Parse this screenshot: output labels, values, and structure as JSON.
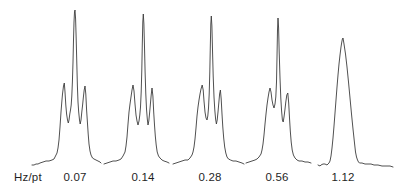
{
  "colors": {
    "background": "#ffffff",
    "trace": "#3c3c3c",
    "text": "#1f1f1f"
  },
  "chart_data": {
    "type": "line",
    "title": "",
    "unit_label": "Hz/pt",
    "unit_label_x": 14,
    "label_row_y": 171,
    "legend": "none",
    "grid": false,
    "axes_shown": false,
    "description_labels": [
      "0.07",
      "0.14",
      "0.28",
      "0.56",
      "1.12"
    ],
    "series": [
      {
        "label": "0.07",
        "label_x": 75,
        "x0": 36,
        "baseline_y": 162,
        "points": [
          [
            -4,
            -3
          ],
          [
            -2,
            -3
          ],
          [
            0,
            -2
          ],
          [
            2,
            -2
          ],
          [
            4,
            -1
          ],
          [
            7,
            0
          ],
          [
            10,
            1
          ],
          [
            13,
            1
          ],
          [
            16,
            2
          ],
          [
            18,
            3
          ],
          [
            19,
            5
          ],
          [
            21,
            9
          ],
          [
            22,
            14
          ],
          [
            23,
            22
          ],
          [
            24,
            35
          ],
          [
            25,
            50
          ],
          [
            25.8,
            60
          ],
          [
            26.5,
            68
          ],
          [
            27.5,
            76
          ],
          [
            28.3,
            79
          ],
          [
            29,
            70
          ],
          [
            29.8,
            57
          ],
          [
            30.6,
            48
          ],
          [
            31.5,
            42
          ],
          [
            32.3,
            39
          ],
          [
            33,
            42
          ],
          [
            33.8,
            48
          ],
          [
            34.5,
            52
          ],
          [
            35.2,
            57
          ],
          [
            35.8,
            66
          ],
          [
            36.4,
            80
          ],
          [
            37,
            100
          ],
          [
            37.5,
            122
          ],
          [
            38,
            140
          ],
          [
            38.5,
            150
          ],
          [
            39,
            152
          ],
          [
            39.6,
            143
          ],
          [
            40.2,
            123
          ],
          [
            40.8,
            99
          ],
          [
            41.4,
            76
          ],
          [
            42,
            60
          ],
          [
            42.7,
            50
          ],
          [
            43.5,
            42
          ],
          [
            44.2,
            38
          ],
          [
            45,
            42
          ],
          [
            45.8,
            50
          ],
          [
            46.6,
            57
          ],
          [
            47.4,
            65
          ],
          [
            48.2,
            72
          ],
          [
            49,
            76
          ],
          [
            49.8,
            68
          ],
          [
            50.6,
            52
          ],
          [
            51.4,
            40
          ],
          [
            52.2,
            28
          ],
          [
            53,
            18
          ],
          [
            54,
            11
          ],
          [
            55,
            7
          ],
          [
            56.5,
            4
          ],
          [
            58,
            3
          ],
          [
            60,
            2
          ],
          [
            62,
            1
          ],
          [
            64,
            0
          ],
          [
            65,
            -1
          ]
        ]
      },
      {
        "label": "0.14",
        "label_x": 143,
        "x0": 104,
        "baseline_y": 162,
        "points": [
          [
            0,
            -2
          ],
          [
            3,
            -1
          ],
          [
            6,
            0
          ],
          [
            9,
            1
          ],
          [
            12,
            1
          ],
          [
            15,
            2
          ],
          [
            17,
            3
          ],
          [
            19,
            6
          ],
          [
            21,
            10
          ],
          [
            22,
            16
          ],
          [
            23,
            25
          ],
          [
            24,
            38
          ],
          [
            25,
            50
          ],
          [
            26,
            58
          ],
          [
            27,
            65
          ],
          [
            28,
            72
          ],
          [
            29,
            77
          ],
          [
            30,
            71
          ],
          [
            31,
            58
          ],
          [
            32,
            47
          ],
          [
            33,
            41
          ],
          [
            34,
            37
          ],
          [
            35,
            41
          ],
          [
            35.8,
            47
          ],
          [
            36.5,
            55
          ],
          [
            37.2,
            70
          ],
          [
            37.8,
            92
          ],
          [
            38.3,
            118
          ],
          [
            38.8,
            140
          ],
          [
            39.3,
            148
          ],
          [
            39.9,
            138
          ],
          [
            40.5,
            115
          ],
          [
            41.1,
            90
          ],
          [
            41.8,
            68
          ],
          [
            42.5,
            53
          ],
          [
            43.3,
            43
          ],
          [
            44,
            37
          ],
          [
            44.8,
            41
          ],
          [
            45.6,
            49
          ],
          [
            46.4,
            58
          ],
          [
            47.2,
            67
          ],
          [
            48,
            74
          ],
          [
            48.9,
            66
          ],
          [
            49.7,
            50
          ],
          [
            50.5,
            37
          ],
          [
            51.3,
            26
          ],
          [
            52.2,
            17
          ],
          [
            53.2,
            10
          ],
          [
            54.5,
            6
          ],
          [
            56,
            4
          ],
          [
            58,
            2
          ],
          [
            60,
            1
          ],
          [
            63,
            0
          ],
          [
            65,
            -1
          ]
        ]
      },
      {
        "label": "0.28",
        "label_x": 210,
        "x0": 173,
        "baseline_y": 162,
        "points": [
          [
            0,
            -2
          ],
          [
            3,
            -1
          ],
          [
            6,
            0
          ],
          [
            9,
            1
          ],
          [
            12,
            2
          ],
          [
            15,
            2
          ],
          [
            17,
            4
          ],
          [
            19,
            7
          ],
          [
            20,
            10
          ],
          [
            21,
            15
          ],
          [
            22,
            23
          ],
          [
            23,
            34
          ],
          [
            24,
            46
          ],
          [
            25,
            55
          ],
          [
            26,
            62
          ],
          [
            27,
            68
          ],
          [
            28,
            73
          ],
          [
            29.2,
            77
          ],
          [
            30.2,
            72
          ],
          [
            31,
            61
          ],
          [
            32,
            50
          ],
          [
            33,
            44
          ],
          [
            34,
            42
          ],
          [
            34.8,
            46
          ],
          [
            35.5,
            54
          ],
          [
            36.2,
            68
          ],
          [
            36.8,
            90
          ],
          [
            37.3,
            115
          ],
          [
            37.8,
            138
          ],
          [
            38.3,
            146
          ],
          [
            38.9,
            136
          ],
          [
            39.5,
            112
          ],
          [
            40.2,
            86
          ],
          [
            41,
            65
          ],
          [
            41.8,
            52
          ],
          [
            42.6,
            43
          ],
          [
            43.4,
            38
          ],
          [
            44.2,
            42
          ],
          [
            45,
            50
          ],
          [
            45.8,
            59
          ],
          [
            46.6,
            68
          ],
          [
            47.4,
            72
          ],
          [
            48.2,
            63
          ],
          [
            49,
            48
          ],
          [
            49.8,
            35
          ],
          [
            50.7,
            24
          ],
          [
            51.7,
            15
          ],
          [
            52.8,
            9
          ],
          [
            54,
            5
          ],
          [
            55.5,
            3
          ],
          [
            57.5,
            2
          ],
          [
            60,
            1
          ],
          [
            63,
            1
          ],
          [
            66,
            0
          ],
          [
            69,
            -1
          ],
          [
            71,
            -2
          ]
        ]
      },
      {
        "label": "0.56",
        "label_x": 277,
        "x0": 243,
        "baseline_y": 162,
        "points": [
          [
            3,
            -1
          ],
          [
            6,
            0
          ],
          [
            9,
            1
          ],
          [
            12,
            2
          ],
          [
            14,
            3
          ],
          [
            16,
            5
          ],
          [
            18,
            8
          ],
          [
            19,
            12
          ],
          [
            20,
            18
          ],
          [
            21,
            27
          ],
          [
            22,
            38
          ],
          [
            23,
            48
          ],
          [
            24,
            57
          ],
          [
            25,
            64
          ],
          [
            26,
            70
          ],
          [
            27,
            74
          ],
          [
            28,
            70
          ],
          [
            29,
            62
          ],
          [
            30,
            57
          ],
          [
            31,
            54
          ],
          [
            32,
            58
          ],
          [
            32.8,
            65
          ],
          [
            33.5,
            80
          ],
          [
            34,
            105
          ],
          [
            34.5,
            132
          ],
          [
            35,
            144
          ],
          [
            35.6,
            134
          ],
          [
            36.2,
            110
          ],
          [
            37,
            84
          ],
          [
            37.8,
            64
          ],
          [
            38.6,
            51
          ],
          [
            39.4,
            42
          ],
          [
            40.2,
            40
          ],
          [
            41,
            45
          ],
          [
            41.9,
            52
          ],
          [
            42.8,
            60
          ],
          [
            43.8,
            67
          ],
          [
            44.8,
            69
          ],
          [
            45.7,
            59
          ],
          [
            46.5,
            44
          ],
          [
            47.3,
            31
          ],
          [
            48.2,
            20
          ],
          [
            49.2,
            12
          ],
          [
            50.4,
            7
          ],
          [
            52,
            4
          ],
          [
            54,
            2
          ],
          [
            56,
            1
          ],
          [
            59,
            1
          ],
          [
            62,
            0
          ],
          [
            65,
            0
          ],
          [
            68,
            -1
          ]
        ]
      },
      {
        "label": "1.12",
        "label_x": 343,
        "x0": 318,
        "baseline_y": 162,
        "points": [
          [
            0,
            -3
          ],
          [
            2,
            -4
          ],
          [
            3,
            -3
          ],
          [
            5,
            -2
          ],
          [
            7,
            -2
          ],
          [
            9,
            -3
          ],
          [
            10,
            -2
          ],
          [
            11,
            -1
          ],
          [
            12,
            1
          ],
          [
            13,
            6
          ],
          [
            14,
            14
          ],
          [
            15,
            24
          ],
          [
            16,
            36
          ],
          [
            17,
            49
          ],
          [
            18,
            62
          ],
          [
            19,
            75
          ],
          [
            20,
            87
          ],
          [
            21,
            98
          ],
          [
            22,
            107
          ],
          [
            23,
            115
          ],
          [
            23.8,
            120
          ],
          [
            24.4,
            123
          ],
          [
            25,
            124
          ],
          [
            26,
            118
          ],
          [
            27.5,
            108
          ],
          [
            29,
            95
          ],
          [
            30.5,
            80
          ],
          [
            32,
            64
          ],
          [
            33.5,
            48
          ],
          [
            35,
            33
          ],
          [
            36.5,
            19
          ],
          [
            37.5,
            10
          ],
          [
            38.5,
            5
          ],
          [
            39.5,
            2
          ],
          [
            40.5,
            0
          ],
          [
            41.5,
            -1
          ],
          [
            44,
            -1
          ],
          [
            47,
            -2
          ],
          [
            50,
            -2
          ],
          [
            53,
            -2
          ],
          [
            56,
            -3
          ],
          [
            60,
            -3
          ],
          [
            64,
            -4
          ],
          [
            68,
            -4
          ],
          [
            72,
            -4
          ],
          [
            75,
            -5
          ]
        ]
      }
    ]
  }
}
